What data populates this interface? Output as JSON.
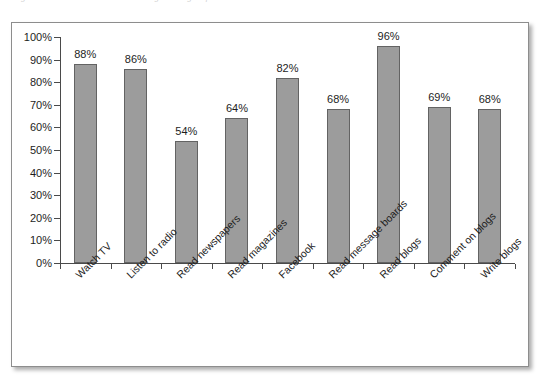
{
  "caption": {
    "text": "Figure 1. Media and social-media usage among respondents"
  },
  "chart_data": {
    "type": "bar",
    "title": "",
    "subtitle": "",
    "xlabel": "",
    "ylabel": "",
    "categories": [
      "Watch TV",
      "Listen to radio",
      "Read newspapers",
      "Read magazines",
      "Facebook",
      "Read message boards",
      "Read blogs",
      "Comment on blogs",
      "Write blogs"
    ],
    "values": [
      88,
      86,
      54,
      64,
      82,
      68,
      96,
      69,
      68
    ],
    "value_labels": [
      "88%",
      "86%",
      "54%",
      "64%",
      "82%",
      "68%",
      "96%",
      "69%",
      "68%"
    ],
    "ylim": [
      0,
      100
    ],
    "ytick_values": [
      0,
      10,
      20,
      30,
      40,
      50,
      60,
      70,
      80,
      90,
      100
    ],
    "ytick_labels": [
      "0%",
      "10%",
      "20%",
      "30%",
      "40%",
      "50%",
      "60%",
      "70%",
      "80%",
      "90%",
      "100%"
    ],
    "grid": false,
    "legend": false,
    "legend_position": "none",
    "bar_color": "#9c9c9c",
    "bar_edge_color": "#636363",
    "axis_color": "#4a4a4a",
    "background_color": "#ffffff",
    "xtick_label_rotation": -45
  }
}
